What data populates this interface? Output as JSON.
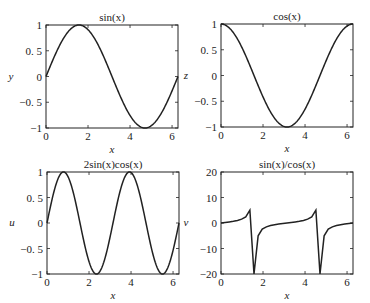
{
  "chart_data": [
    {
      "type": "line",
      "title": "sin(x)",
      "xlabel": "x",
      "ylabel": "y",
      "xlim": [
        0,
        6.2832
      ],
      "ylim": [
        -1,
        1
      ],
      "xticks": [
        "0",
        "2",
        "4",
        "6"
      ],
      "yticks": [
        "-1",
        "-0.5",
        "0",
        "0.5",
        "1"
      ],
      "grid": false,
      "function": "sin",
      "box": {
        "x0": 46,
        "y0": 25,
        "x1": 178,
        "y1": 128
      }
    },
    {
      "type": "line",
      "title": "cos(x)",
      "xlabel": "x",
      "ylabel": "z",
      "xlim": [
        0,
        6.2832
      ],
      "ylim": [
        -1,
        1
      ],
      "xticks": [
        "0",
        "2",
        "4",
        "6"
      ],
      "yticks": [
        "-1",
        "-0.5",
        "0",
        "0.5",
        "1"
      ],
      "grid": false,
      "function": "cos",
      "box": {
        "x0": 221,
        "y0": 24,
        "x1": 353,
        "y1": 127
      }
    },
    {
      "type": "line",
      "title": "2sin(x)cos(x)",
      "xlabel": "x",
      "ylabel": "u",
      "xlim": [
        0,
        6.2832
      ],
      "ylim": [
        -1,
        1
      ],
      "xticks": [
        "0",
        "2",
        "4",
        "6"
      ],
      "yticks": [
        "-1",
        "-0.5",
        "0",
        "0.5",
        "1"
      ],
      "grid": false,
      "function": "sin2",
      "box": {
        "x0": 47,
        "y0": 172,
        "x1": 179,
        "y1": 274
      }
    },
    {
      "type": "line",
      "title": "sin(x)/cos(x)",
      "xlabel": "x",
      "ylabel": "v",
      "xlim": [
        0,
        6.2832
      ],
      "ylim": [
        -20,
        20
      ],
      "xticks": [
        "0",
        "2",
        "4",
        "6"
      ],
      "yticks": [
        "-20",
        "-10",
        "0",
        "10",
        "20"
      ],
      "grid": false,
      "function": "tan",
      "box": {
        "x0": 221,
        "y0": 172,
        "x1": 353,
        "y1": 274
      }
    }
  ],
  "style": {
    "line_color": "#222222",
    "axis_color": "#222222",
    "background": "#ffffff"
  }
}
